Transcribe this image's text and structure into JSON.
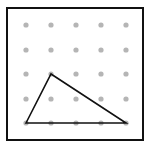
{
  "diagram": {
    "type": "geoboard",
    "frame": {
      "x": 7,
      "y": 8,
      "width": 136,
      "height": 132,
      "stroke": "#111111",
      "stroke_width": 2
    },
    "grid": {
      "cols": 5,
      "rows": 5,
      "x": [
        26,
        51,
        76,
        101,
        126
      ],
      "y": [
        25,
        50,
        74,
        99,
        123
      ],
      "dot_radius": 2.6,
      "dot_color": "#b5b5b5"
    },
    "triangle": {
      "vertices_grid": [
        [
          0,
          4
        ],
        [
          1,
          2
        ],
        [
          4,
          4
        ]
      ],
      "stroke": "#111111",
      "stroke_width": 1.6
    }
  }
}
